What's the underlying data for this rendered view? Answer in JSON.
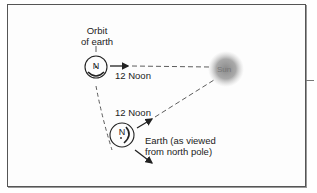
{
  "diagram": {
    "orbit_label_line1": "Orbit",
    "orbit_label_line2": "of earth",
    "noon_label_top": "12 Noon",
    "noon_label_bottom": "12 Noon",
    "sun_label": "Sun",
    "earth_label_line1": "Earth (as viewed",
    "earth_label_line2": "from north pole)",
    "pole_label_top": "N",
    "pole_label_bottom": "N",
    "colors": {
      "line": "#333333",
      "sun": "#8a8a8a",
      "frame": "#555555"
    }
  }
}
